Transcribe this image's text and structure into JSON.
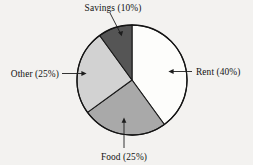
{
  "chart_data": {
    "type": "pie",
    "title": "",
    "subtitle": "",
    "xlabel": "",
    "ylabel": "",
    "legend_position": "none",
    "grid": false,
    "labels_inline": true,
    "start_angle_deg": 0,
    "direction": "clockwise",
    "categories": [
      "Rent",
      "Food",
      "Other",
      "Savings"
    ],
    "values": [
      40,
      25,
      25,
      10
    ],
    "units": "percent",
    "slices": [
      {
        "name": "Rent",
        "label": "Rent (40%)",
        "value": 40,
        "color": "#fdfdfb",
        "start_deg": 0,
        "end_deg": 144,
        "label_position": "right",
        "arrow_direction": "left"
      },
      {
        "name": "Food",
        "label": "Food (25%)",
        "value": 25,
        "color": "#a9a9a9",
        "start_deg": 144,
        "end_deg": 234,
        "label_position": "bottom",
        "arrow_direction": "up"
      },
      {
        "name": "Other",
        "label": "Other (25%)",
        "value": 25,
        "color": "#d2d2d2",
        "start_deg": 234,
        "end_deg": 324,
        "label_position": "left",
        "arrow_direction": "right"
      },
      {
        "name": "Savings",
        "label": "Savings (10%)",
        "value": 10,
        "color": "#555555",
        "start_deg": 324,
        "end_deg": 360,
        "label_position": "top",
        "arrow_direction": "down-right"
      }
    ],
    "background_color": "#f3f2f0",
    "outline_color": "#141414",
    "text_color": "#121212"
  }
}
